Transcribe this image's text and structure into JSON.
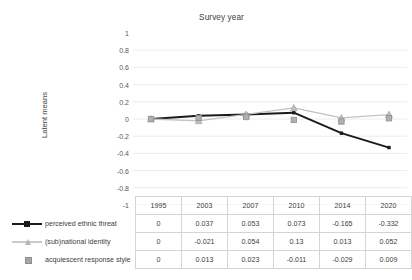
{
  "chart_data": {
    "type": "line",
    "title": "Survey year",
    "xlabel": "",
    "ylabel": "Latent means",
    "categories": [
      "1995",
      "2003",
      "2007",
      "2010",
      "2014",
      "2020"
    ],
    "ylim": [
      -1,
      1
    ],
    "ytick_labels": [
      "1",
      "0.8",
      "0.6",
      "0.4",
      "0.2",
      "0",
      "-0.2",
      "-0.4",
      "-0.6",
      "-0.8",
      "-1"
    ],
    "ytick_values": [
      1,
      0.8,
      0.6,
      0.4,
      0.2,
      0,
      -0.2,
      -0.4,
      -0.6,
      -0.8,
      -1
    ],
    "grid": true,
    "legend_position": "table-left",
    "series": [
      {
        "name": "perceived ethnic threat",
        "values": [
          0,
          0.037,
          0.053,
          0.073,
          -0.165,
          -0.332
        ],
        "labels": [
          "0",
          "0.037",
          "0.053",
          "0.073",
          "-0.165",
          "-0.332"
        ],
        "color": "#1a1a1a",
        "marker": "square"
      },
      {
        "name": "(sub)national identity",
        "values": [
          0,
          -0.021,
          0.054,
          0.13,
          0.013,
          0.052
        ],
        "labels": [
          "0",
          "-0.021",
          "0.054",
          "0.13",
          "0.013",
          "0.052"
        ],
        "color": "#c2c2c2",
        "marker": "triangle"
      },
      {
        "name": "acquiescent response style",
        "values": [
          0,
          0.013,
          0.023,
          -0.011,
          -0.029,
          0.009
        ],
        "labels": [
          "0",
          "0.013",
          "0.023",
          "-0.011",
          "-0.029",
          "0.009"
        ],
        "color": "#a6a6a6",
        "marker": "square-only"
      }
    ]
  },
  "table": {
    "header": [
      "1995",
      "2003",
      "2007",
      "2010",
      "2014",
      "2020"
    ],
    "rows": [
      {
        "label": "perceived ethnic threat",
        "values": [
          "0",
          "0.037",
          "0.053",
          "0.073",
          "-0.165",
          "-0.332"
        ]
      },
      {
        "label": "(sub)national identity",
        "values": [
          "0",
          "-0.021",
          "0.054",
          "0.13",
          "0.013",
          "0.052"
        ]
      },
      {
        "label": "acquiescent response style",
        "values": [
          "0",
          "0.013",
          "0.023",
          "-0.011",
          "-0.029",
          "0.009"
        ]
      }
    ]
  }
}
